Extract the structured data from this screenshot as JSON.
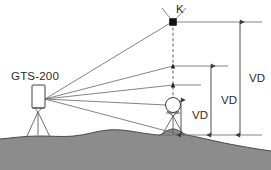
{
  "diagram": {
    "instrument": {
      "name": "GTS-200",
      "label": "GTS-200",
      "icon": "total-station-icon",
      "x": 38,
      "y": 97
    },
    "target_point": {
      "label": "K",
      "name": "point-k",
      "icon": "prism-target-icon",
      "x": 173,
      "y": 22
    },
    "reflector": {
      "label": "",
      "name": "prism-reflector",
      "icon": "circle-prism-icon",
      "x": 173,
      "y": 105
    },
    "dimensions": [
      {
        "label": "VD",
        "name": "vd-small",
        "top": 100,
        "bottom": 135,
        "axis_x": 181,
        "label_x": 192,
        "label_y": 119
      },
      {
        "label": "VD",
        "name": "vd-medium",
        "top": 66,
        "bottom": 135,
        "axis_x": 211,
        "label_x": 222,
        "label_y": 104
      },
      {
        "label": "VD",
        "name": "vd-large",
        "top": 22,
        "bottom": 135,
        "axis_x": 240,
        "label_x": 250,
        "label_y": 82
      }
    ],
    "sight_lines": [
      {
        "name": "sight-line-to-k",
        "from_x": 45,
        "from_y": 99,
        "to_x": 173,
        "to_y": 22
      },
      {
        "name": "sight-line-upper",
        "from_x": 45,
        "from_y": 99,
        "to_x": 173,
        "to_y": 66
      },
      {
        "name": "sight-line-middle",
        "from_x": 45,
        "from_y": 99,
        "to_x": 173,
        "to_y": 85
      },
      {
        "name": "sight-line-to-prism",
        "from_x": 45,
        "from_y": 99,
        "to_x": 168,
        "to_y": 105
      },
      {
        "name": "sight-line-to-ground",
        "from_x": 45,
        "from_y": 99,
        "to_x": 176,
        "to_y": 134
      }
    ],
    "reference_lines": [
      {
        "name": "reference-line-k",
        "y": 22,
        "x1": 173,
        "x2": 262
      },
      {
        "name": "reference-line-upper",
        "y": 66,
        "x1": 173,
        "x2": 228
      },
      {
        "name": "reference-line-middle",
        "y": 85,
        "x1": 173,
        "x2": 201
      },
      {
        "name": "reference-line-base",
        "y": 135,
        "x1": 158,
        "x2": 262
      }
    ],
    "vertical_axis": {
      "name": "vertical-dashed-axis",
      "x": 173,
      "y_top": 22,
      "y_bottom": 105,
      "style": "dashed"
    },
    "terrain": {
      "name": "ground-terrain",
      "fill_color": "#8c8c8c",
      "outline_color": "#4a4a4a"
    },
    "colors": {
      "line": "#6e6e6e",
      "dark_line": "#3c3c3c",
      "ground_fill": "#8c8c8c",
      "text": "#2b2b2b",
      "background": "#ffffff",
      "marker_fill": "#111111"
    },
    "footer_note": ""
  }
}
